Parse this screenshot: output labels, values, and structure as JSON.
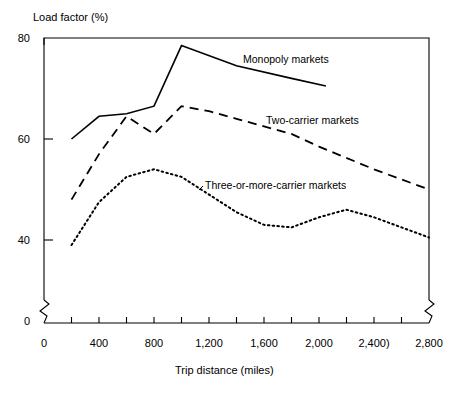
{
  "chart_data": {
    "type": "line",
    "title": "",
    "ylabel": "Load factor (%)",
    "xlabel": "Trip distance (miles)",
    "xlim": [
      0,
      2800
    ],
    "ylim": [
      36,
      80
    ],
    "y_axis_break": true,
    "y_axis_break_note": "axis broken between 0 and the plotted range",
    "grid": false,
    "legend_position": "inline-annotations",
    "yticks": [
      0,
      40,
      60,
      80
    ],
    "ytick_labels": [
      "0",
      "40",
      "60",
      "80"
    ],
    "xticks": [
      0,
      200,
      400,
      600,
      800,
      1000,
      1200,
      1400,
      1600,
      1800,
      2000,
      2200,
      2400,
      2600,
      2800
    ],
    "xtick_labels_shown": [
      "0",
      "400",
      "800",
      "1,200",
      "1,600",
      "2,000",
      "2,400)",
      "2,800"
    ],
    "xtick_label_values": [
      0,
      400,
      800,
      1200,
      1600,
      2000,
      2400,
      2800
    ],
    "series": [
      {
        "name": "Monopoly markets",
        "style": "solid",
        "x": [
          200,
          400,
          600,
          800,
          1000,
          1400,
          1800,
          2050
        ],
        "values": [
          60.0,
          64.5,
          65.0,
          66.5,
          78.5,
          74.5,
          72.0,
          70.5
        ]
      },
      {
        "name": "Two-carrier markets",
        "style": "dashed",
        "x": [
          200,
          400,
          600,
          800,
          1000,
          1200,
          1400,
          1600,
          1800,
          2000,
          2400,
          2800
        ],
        "values": [
          48.0,
          57.0,
          64.5,
          61.0,
          66.5,
          65.5,
          64.0,
          62.5,
          61.0,
          58.5,
          54.0,
          50.0
        ]
      },
      {
        "name": "Three-or-more-carrier markets",
        "style": "dotted",
        "x": [
          200,
          400,
          600,
          800,
          1000,
          1200,
          1400,
          1600,
          1800,
          2000,
          2200,
          2400,
          2600,
          2800
        ],
        "values": [
          39.0,
          47.5,
          52.5,
          54.0,
          52.5,
          49.0,
          45.5,
          43.0,
          42.5,
          44.5,
          46.0,
          44.5,
          42.5,
          40.5
        ]
      }
    ],
    "annotations": [
      {
        "text": "Monopoly markets",
        "series": "Monopoly markets"
      },
      {
        "text": "Two-carrier markets",
        "series": "Two-carrier markets"
      },
      {
        "text": "Three-or-more-carrier markets",
        "series": "Three-or-more-carrier markets"
      }
    ],
    "colors": {
      "line": "#000000",
      "axis": "#000000",
      "background": "#ffffff"
    }
  }
}
